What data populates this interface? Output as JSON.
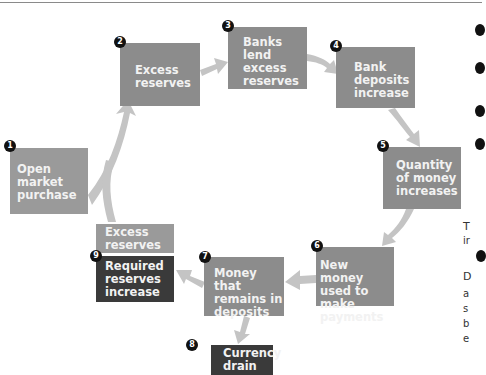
{
  "diagram": {
    "steps": [
      {
        "n": "1",
        "label": "Open\nmarket\npurchase"
      },
      {
        "n": "2",
        "label": "Excess\nreserves"
      },
      {
        "n": "3",
        "label": "Banks\nlend\nexcess\nreserves"
      },
      {
        "n": "4",
        "label": "Bank\ndeposits\nincrease"
      },
      {
        "n": "5",
        "label": "Quantity\nof money\nincreases"
      },
      {
        "n": "6",
        "label": "New money\nused to make\npayments"
      },
      {
        "n": "7",
        "label": "Money that\nremains in\ndeposits"
      },
      {
        "n": "8",
        "label": "Currency\ndrain"
      },
      {
        "n": "9",
        "label": "Required\nreserves\nincrease",
        "top_label": "Excess\nreserves"
      }
    ],
    "colors": {
      "box": "#8c8c8c",
      "box_light": "#9a9a9a",
      "box_dark": "#3a3a3a",
      "arrow": "#c4c4c4",
      "badge": "#111111"
    }
  },
  "side_text": {
    "line1": "T",
    "line2": "ir",
    "line3": "D",
    "line4": "a",
    "line5": "s",
    "line6": "b",
    "line7": "e"
  }
}
